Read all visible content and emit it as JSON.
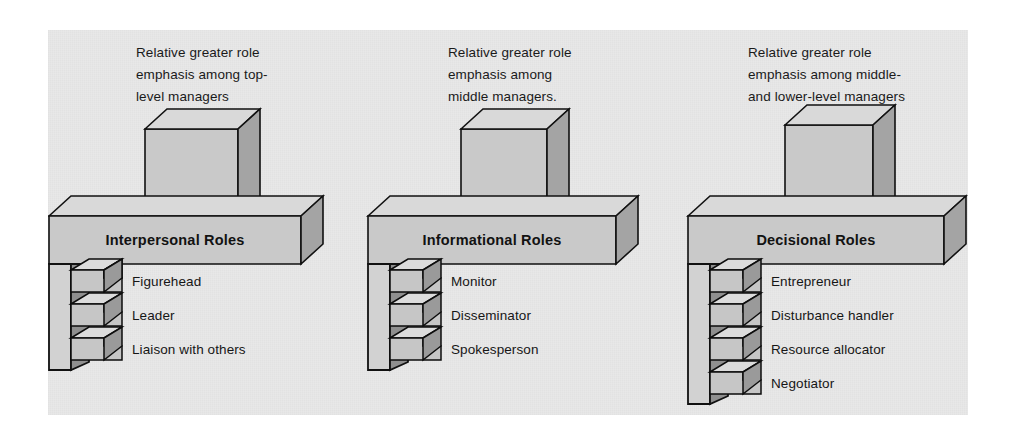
{
  "figure": {
    "background_color": "#ffffff",
    "panel_color": "#e8e8e8",
    "ink_color": "#111111",
    "face_front_color": "#c9c9c9",
    "face_top_color": "#d9d9d9",
    "face_side_color": "#a4a4a4"
  },
  "columns": [
    {
      "id": "interpersonal",
      "caption_lines": [
        "Relative greater role",
        "emphasis among top-",
        "level managers"
      ],
      "bar_label": "Interpersonal Roles",
      "roles": [
        "Figurehead",
        "Leader",
        "Liaison with others"
      ]
    },
    {
      "id": "informational",
      "caption_lines": [
        "Relative greater role",
        "emphasis among",
        "middle managers."
      ],
      "bar_label": "Informational Roles",
      "roles": [
        "Monitor",
        "Disseminator",
        "Spokesperson"
      ]
    },
    {
      "id": "decisional",
      "caption_lines": [
        "Relative greater role",
        "emphasis among middle-",
        "and lower-level managers"
      ],
      "bar_label": "Decisional Roles",
      "roles": [
        "Entrepreneur",
        "Disturbance handler",
        "Resource allocator",
        "Negotiator"
      ]
    }
  ]
}
